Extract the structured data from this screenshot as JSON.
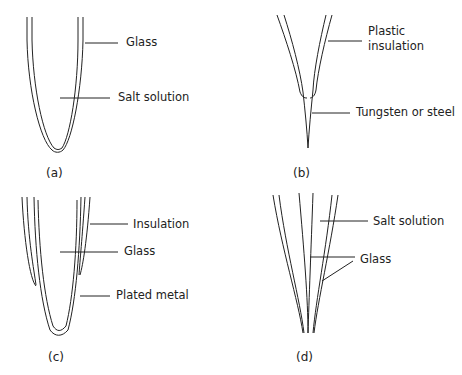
{
  "panels": [
    {
      "id": "a",
      "caption": "(a)",
      "labels": [
        "Glass",
        "Salt solution"
      ]
    },
    {
      "id": "b",
      "caption": "(b)",
      "labels": [
        "Plastic",
        "insulation",
        "Tungsten or steel"
      ]
    },
    {
      "id": "c",
      "caption": "(c)",
      "labels": [
        "Insulation",
        "Glass",
        "Plated metal"
      ]
    },
    {
      "id": "d",
      "caption": "(d)",
      "labels": [
        "Salt solution",
        "Glass"
      ]
    }
  ]
}
